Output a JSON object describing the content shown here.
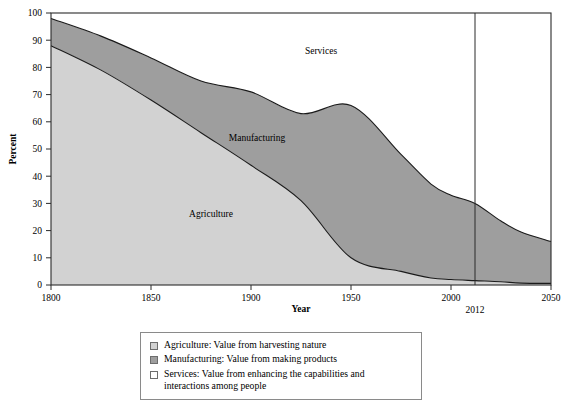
{
  "chart_data": {
    "type": "area",
    "stacked": true,
    "title": "",
    "xlabel": "Year",
    "ylabel": "Percent",
    "xlim": [
      1800,
      2050
    ],
    "ylim": [
      0,
      100
    ],
    "xticks": [
      1800,
      1850,
      1900,
      1950,
      2000,
      2050
    ],
    "xtick_labels": [
      "1800",
      "1850",
      "1900",
      "1950",
      "2000",
      "2050"
    ],
    "yticks": [
      0,
      10,
      20,
      30,
      40,
      50,
      60,
      70,
      80,
      90,
      100
    ],
    "ytick_labels": [
      "0",
      "10",
      "20",
      "30",
      "40",
      "50",
      "60",
      "70",
      "80",
      "90",
      "100"
    ],
    "grid": false,
    "legend_position": "below-plot",
    "annotations": [
      {
        "name": "year-2012-marker",
        "type": "vertical-line",
        "x": 2012,
        "label": "2012"
      }
    ],
    "area_labels": [
      {
        "name": "Services",
        "x": 1935,
        "y": 85
      },
      {
        "name": "Manufacturing",
        "x": 1903,
        "y": 53
      },
      {
        "name": "Agriculture",
        "x": 1880,
        "y": 25
      }
    ],
    "x": [
      1800,
      1825,
      1850,
      1875,
      1900,
      1925,
      1950,
      1975,
      1990,
      2000,
      2012,
      2025,
      2035,
      2050
    ],
    "series": [
      {
        "name": "Agriculture",
        "color": "#d2d2d2",
        "values": [
          88,
          79,
          68,
          56,
          44,
          31,
          10,
          5,
          2.6,
          2.0,
          1.6,
          1.2,
          0.7,
          0.6
        ]
      },
      {
        "name": "Manufacturing",
        "color": "#9e9e9e",
        "values": [
          10,
          12.5,
          15.5,
          19,
          27,
          32,
          56,
          43,
          34.5,
          31,
          28.4,
          22.3,
          18.8,
          15.4
        ]
      },
      {
        "name": "Services",
        "color": "#ffffff",
        "values": [
          2,
          8.5,
          16.5,
          25,
          29,
          37,
          34,
          52,
          62.9,
          67,
          70,
          76.5,
          80.5,
          84
        ]
      }
    ],
    "cumulative_upper_agriculture": [
      88,
      79,
      68,
      56,
      44,
      31,
      10,
      5,
      2.6,
      2.0,
      1.6,
      1.2,
      0.7,
      0.6
    ],
    "cumulative_upper_manufacturing": [
      98,
      91.5,
      83.5,
      75,
      71,
      63,
      66,
      48,
      37.1,
      33,
      30,
      23.5,
      19.5,
      16
    ]
  },
  "axes": {
    "y_title": "Percent",
    "x_title": "Year"
  },
  "legend": {
    "items": [
      {
        "name": "Agriculture",
        "swatch_color": "#d2d2d2",
        "text": "Agriculture: Value from harvesting nature"
      },
      {
        "name": "Manufacturing",
        "swatch_color": "#9e9e9e",
        "text": "Manufacturing: Value from making products"
      },
      {
        "name": "Services",
        "swatch_color": "#ffffff",
        "text": "Services: Value from enhancing the capabilities and\ninteractions among people"
      }
    ]
  },
  "colors": {
    "agriculture": "#d2d2d2",
    "manufacturing": "#9e9e9e",
    "services": "#ffffff",
    "line": "#1a1a1a",
    "axis": "#2b2b2b",
    "legend_border": "#8a8a8a"
  }
}
